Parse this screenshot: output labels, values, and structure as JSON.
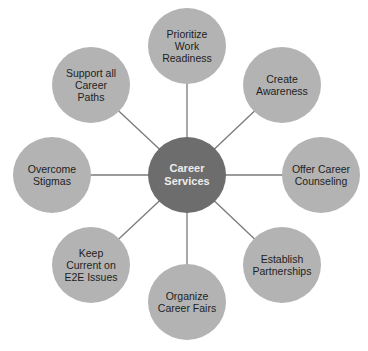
{
  "diagram": {
    "title": "",
    "colors": {
      "hub_fill": "#6d6d6d",
      "node_fill": "#b3b3b3",
      "connector": "#7a7a7a",
      "hub_text": "#ececec",
      "node_text": "#1e1e1e"
    },
    "hub": {
      "label": "Career\nServices",
      "cx": 187,
      "cy": 175
    },
    "nodes": [
      {
        "id": "top",
        "label": "Prioritize\nWork\nReadiness",
        "cx": 187,
        "cy": 46
      },
      {
        "id": "top-right",
        "label": "Create\nAwareness",
        "cx": 282,
        "cy": 85
      },
      {
        "id": "right",
        "label": "Offer Career\nCounseling",
        "cx": 321,
        "cy": 175
      },
      {
        "id": "bottom-right",
        "label": "Establish\nPartnerships",
        "cx": 282,
        "cy": 265
      },
      {
        "id": "bottom",
        "label": "Organize\nCareer Fairs",
        "cx": 187,
        "cy": 302
      },
      {
        "id": "bottom-left",
        "label": "Keep\nCurrent on\nE2E Issues",
        "cx": 91,
        "cy": 265
      },
      {
        "id": "left",
        "label": "Overcome\nStigmas",
        "cx": 52,
        "cy": 175
      },
      {
        "id": "top-left",
        "label": "Support all\nCareer\nPaths",
        "cx": 91,
        "cy": 85
      }
    ]
  }
}
